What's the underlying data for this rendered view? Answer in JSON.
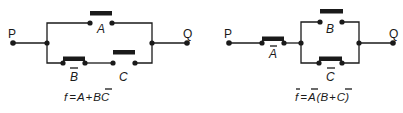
{
  "left_circuit": {
    "terminal_left": "P",
    "terminal_right": "Q",
    "switches": [
      {
        "label": "A",
        "negated": false,
        "state": "open",
        "branch": "top"
      },
      {
        "label": "B",
        "negated": true,
        "state": "closed",
        "branch": "bottom"
      },
      {
        "label": "C",
        "negated": false,
        "state": "open",
        "branch": "bottom"
      }
    ],
    "formula": {
      "lhs": "f",
      "eq": "=",
      "t1": "A",
      "plus": "+",
      "t2_bar": "B",
      "t2": "C"
    }
  },
  "right_circuit": {
    "terminal_left": "P",
    "terminal_right": "Q",
    "switches": [
      {
        "label": "A",
        "negated": true,
        "state": "closed",
        "branch": "series"
      },
      {
        "label": "B",
        "negated": false,
        "state": "open",
        "branch": "top"
      },
      {
        "label": "C",
        "negated": true,
        "state": "closed",
        "branch": "bottom"
      }
    ],
    "formula": {
      "lhs_bar": "f",
      "eq": "=",
      "t1_bar": "A",
      "open": "(",
      "t2": "B",
      "plus": "+",
      "t3_bar": "C",
      "close": ")"
    }
  },
  "colors": {
    "ink": "#1a1a1a",
    "background": "#ffffff"
  }
}
